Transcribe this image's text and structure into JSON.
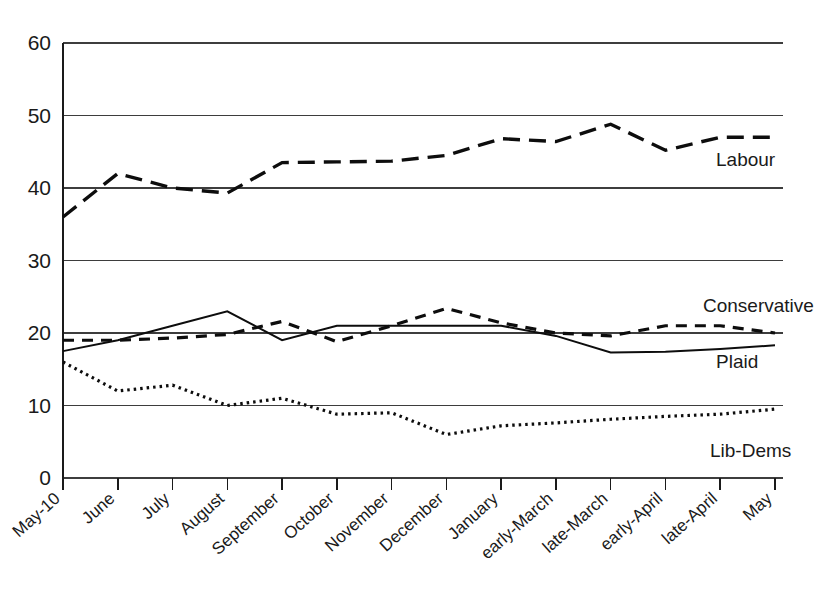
{
  "chart_data": {
    "type": "line",
    "title": "",
    "subtitle": "",
    "xlabel": "",
    "ylabel": "",
    "ylim": [
      0,
      60
    ],
    "yticks": [
      0,
      10,
      20,
      30,
      40,
      50,
      60
    ],
    "grid": true,
    "legend_position": "right-inline",
    "categories": [
      "May-10",
      "June",
      "July",
      "August",
      "September",
      "October",
      "November",
      "December",
      "January",
      "early-March",
      "late-March",
      "early-April",
      "late-April",
      "May"
    ],
    "series": [
      {
        "name": "Labour",
        "style": "dashed",
        "values": [
          36.0,
          42.0,
          40.0,
          39.3,
          43.5,
          43.6,
          43.7,
          44.5,
          46.8,
          46.4,
          48.8,
          45.2,
          47.0,
          47.0
        ]
      },
      {
        "name": "Conservative",
        "style": "dashed-short",
        "values": [
          19.0,
          19.0,
          19.3,
          19.8,
          21.6,
          18.8,
          21.0,
          23.4,
          21.4,
          20.0,
          19.6,
          21.0,
          21.0,
          20.0
        ]
      },
      {
        "name": "Plaid",
        "style": "solid",
        "values": [
          17.5,
          19.0,
          21.0,
          23.0,
          19.0,
          21.0,
          21.0,
          21.0,
          21.0,
          19.6,
          17.3,
          17.4,
          17.8,
          18.3
        ]
      },
      {
        "name": "Lib-Dems",
        "style": "dotted",
        "values": [
          16.0,
          12.0,
          12.8,
          10.0,
          11.0,
          8.8,
          9.0,
          6.0,
          7.2,
          7.6,
          8.1,
          8.5,
          8.8,
          9.5
        ]
      }
    ]
  },
  "series_labels": [
    {
      "name": "Labour",
      "x": 716,
      "y": 166
    },
    {
      "name": "Conservative",
      "x": 703,
      "y": 312
    },
    {
      "name": "Plaid",
      "x": 716,
      "y": 368
    },
    {
      "name": "Lib-Dems",
      "x": 710,
      "y": 457
    }
  ],
  "axis": {
    "y_tick_labels": [
      "60",
      "50",
      "40",
      "30",
      "20",
      "10",
      "0"
    ],
    "x_tick_labels": [
      "May-10",
      "June",
      "July",
      "August",
      "September",
      "October",
      "November",
      "December",
      "January",
      "early-March",
      "late-March",
      "early-April",
      "late-April",
      "May"
    ]
  }
}
